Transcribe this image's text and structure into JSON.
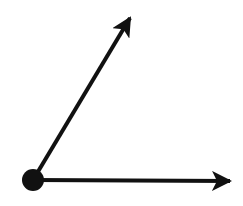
{
  "diagram": {
    "type": "angle",
    "stroke_color": "#111111",
    "background": "#ffffff",
    "vertex": {
      "x": 33,
      "y": 180,
      "r": 11
    },
    "rays": [
      {
        "name": "upper-ray",
        "x1": 33,
        "y1": 180,
        "x2": 130,
        "y2": 18
      },
      {
        "name": "horizontal-ray",
        "x1": 33,
        "y1": 180,
        "x2": 230,
        "y2": 181
      }
    ]
  }
}
